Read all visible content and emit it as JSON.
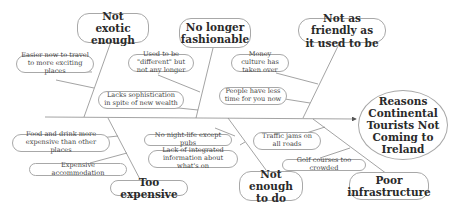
{
  "effect": "Reasons Continental Tourists Not Coming to Ireland",
  "causes": [
    {
      "label": "Not exotic enough",
      "position": "top",
      "subcauses": [
        "Easier now to travel to more exciting places",
        "Lacks sophistication in spite of new wealth"
      ]
    },
    {
      "label": "No longer fashionable",
      "position": "top",
      "subcauses": [
        "Used to be \"different\" but not any longer"
      ]
    },
    {
      "label": "Not as friendly as it used to be",
      "position": "top",
      "subcauses": [
        "Money culture has taken over",
        "People have less time for you now"
      ]
    },
    {
      "label": "Too expensive",
      "position": "bottom",
      "subcauses": [
        "Food and drink more expensive than other places",
        "Expensive accommodation"
      ]
    },
    {
      "label": "Not enough to do",
      "position": "bottom",
      "subcauses": [
        "No night-life  except pubs",
        "Lack of integrated information about what's on"
      ]
    },
    {
      "label": "Poor infrastructure",
      "position": "bottom",
      "subcauses": [
        "Traffic jams on all roads",
        "Golf courses too crowded"
      ]
    }
  ],
  "colors": {
    "line": "#8c8c8c",
    "border": "#a8a8a8",
    "text": "#2a2a2a"
  }
}
